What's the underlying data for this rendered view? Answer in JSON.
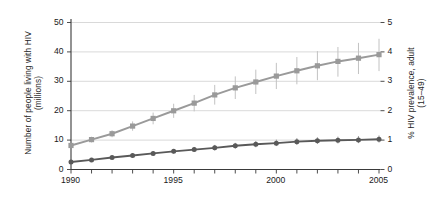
{
  "chart_data": {
    "type": "line",
    "title": "",
    "subtitle": "",
    "xlabel": "",
    "ylabel": "Number of people living with HIV\n(millions)",
    "y2label": "% HIV prevalence, adult\n(15–49)",
    "x": [
      1990,
      1991,
      1992,
      1993,
      1994,
      1995,
      1996,
      1997,
      1998,
      1999,
      2000,
      2001,
      2002,
      2003,
      2004,
      2005
    ],
    "xtick_labels": [
      "1990",
      "1995",
      "2000",
      "2005"
    ],
    "xtick_values": [
      1990,
      1995,
      2000,
      2005
    ],
    "xlim": [
      1990,
      2005
    ],
    "ylim": [
      0,
      50
    ],
    "ytick_labels": [
      "0",
      "10",
      "20",
      "30",
      "40",
      "50"
    ],
    "ytick_values": [
      0,
      10,
      20,
      30,
      40,
      50
    ],
    "y2lim": [
      0,
      5
    ],
    "y2tick_labels": [
      "0",
      "1",
      "2",
      "3",
      "4",
      "5"
    ],
    "y2tick_values": [
      0,
      1,
      2,
      3,
      4,
      5
    ],
    "grid": "horizontal",
    "legend": "none",
    "series": [
      {
        "name": "Number of people living with HIV (millions)",
        "axis": "left",
        "marker": "square",
        "color": "#9a9a9a",
        "errorbar_color": "#c2c2c2",
        "values": [
          8.0,
          10.0,
          12.0,
          14.6,
          17.2,
          19.8,
          22.4,
          25.2,
          27.6,
          29.6,
          31.6,
          33.4,
          35.1,
          36.6,
          37.7,
          38.9
        ],
        "error_low": [
          7.2,
          9.0,
          10.8,
          13.0,
          15.2,
          17.4,
          19.6,
          21.9,
          23.8,
          25.5,
          27.2,
          28.8,
          30.2,
          31.4,
          32.3,
          33.3
        ],
        "error_high": [
          8.8,
          11.0,
          13.2,
          16.2,
          19.2,
          22.2,
          25.2,
          28.6,
          31.5,
          33.8,
          36.1,
          38.1,
          40.1,
          41.5,
          42.9,
          44.3
        ]
      },
      {
        "name": "% HIV prevalence, adult (15-49)",
        "axis": "right",
        "marker": "circle",
        "color": "#595959",
        "errorbar_color": "#8f8f8f",
        "values": [
          0.24,
          0.31,
          0.39,
          0.46,
          0.53,
          0.6,
          0.66,
          0.72,
          0.79,
          0.84,
          0.88,
          0.93,
          0.96,
          0.98,
          0.99,
          1.01
        ],
        "error_low": [
          0.21,
          0.27,
          0.34,
          0.4,
          0.46,
          0.52,
          0.58,
          0.63,
          0.69,
          0.74,
          0.78,
          0.82,
          0.85,
          0.87,
          0.88,
          0.9
        ],
        "error_high": [
          0.28,
          0.36,
          0.44,
          0.52,
          0.6,
          0.68,
          0.75,
          0.82,
          0.89,
          0.95,
          1.0,
          1.05,
          1.08,
          1.1,
          1.12,
          1.14
        ]
      }
    ]
  }
}
